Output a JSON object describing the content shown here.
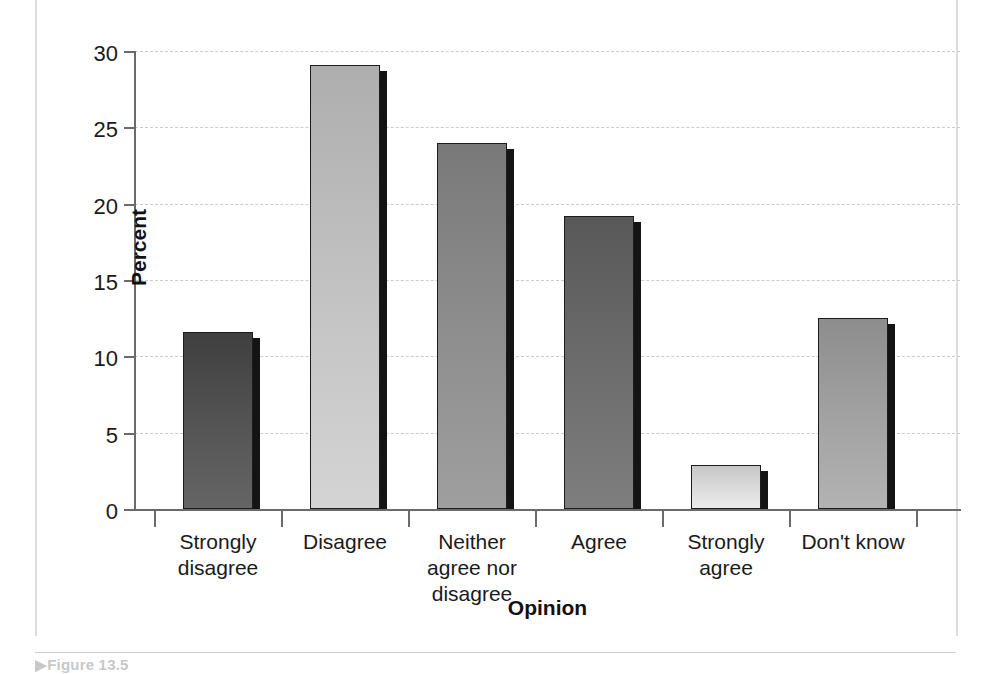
{
  "figure": {
    "caption": "▶Figure 13.5",
    "caption_marker": "▶"
  },
  "chart_data": {
    "type": "bar",
    "title": "",
    "subtitle": "",
    "xlabel": "Opinion",
    "ylabel": "Percent",
    "categories": [
      "Strongly\ndisagree",
      "Disagree",
      "Neither\nagree nor\ndisagree",
      "Agree",
      "Strongly\nagree",
      "Don't know"
    ],
    "category_lines": [
      [
        "Strongly",
        "disagree"
      ],
      [
        "Disagree"
      ],
      [
        "Neither",
        "agree nor",
        "disagree"
      ],
      [
        "Agree"
      ],
      [
        "Strongly",
        "agree"
      ],
      [
        "Don't know"
      ]
    ],
    "values": [
      11.6,
      29.1,
      24.0,
      19.2,
      2.9,
      12.5
    ],
    "bar_colors": [
      "#555555",
      "#c4c4c4",
      "#8f8f8f",
      "#6e6e6e",
      "#dcdcdc",
      "#a3a3a3"
    ],
    "ylim": [
      0,
      30
    ],
    "yticks": [
      0,
      5,
      10,
      15,
      20,
      25,
      30
    ],
    "ytick_labels": [
      "0",
      "5",
      "10",
      "15",
      "20",
      "25",
      "30"
    ],
    "grid": true,
    "grid_axis": "y",
    "legend": false,
    "legend_position": "none"
  },
  "colors": {
    "axis": "#6b6b6b",
    "gridline": "#cccccc",
    "bar_outline": "#1c1c1c",
    "bar_shadow": "#141414",
    "text": "#1a1a1a",
    "page_rule": "#dcdcdc",
    "caption": "#c8c8c8"
  }
}
